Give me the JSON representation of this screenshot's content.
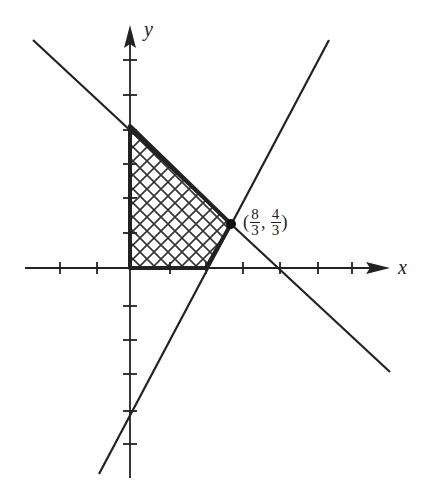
{
  "diagram": {
    "type": "linear-programming feasible region",
    "axes": {
      "x_label": "x",
      "y_label": "y",
      "x_ticks": [
        -2,
        -1,
        1,
        2,
        3,
        4,
        5,
        6
      ],
      "y_ticks": [
        -6,
        -5,
        -4,
        -3,
        -2,
        -1,
        1,
        2,
        3,
        4,
        5,
        6
      ]
    },
    "lines": [
      {
        "equation": "x + y = 4"
      },
      {
        "equation": "2x - y = 4"
      }
    ],
    "region_vertices": [
      [
        0,
        0
      ],
      [
        2,
        0
      ],
      [
        2.6667,
        1.3333
      ],
      [
        0,
        4
      ]
    ],
    "region_fill": "crosshatch",
    "labeled_point": {
      "x_num": "8",
      "x_den": "3",
      "y_num": "4",
      "y_den": "3",
      "open": "(",
      "sep": ",",
      "close": ")"
    },
    "colors": {
      "ink": "#222222",
      "background": "#ffffff"
    }
  }
}
